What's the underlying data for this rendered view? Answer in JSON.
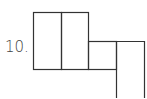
{
  "problem": {
    "number_label": "10.",
    "figure": "net-of-squares",
    "stroke_color": "#333333",
    "fill_color": "#ffffff"
  }
}
